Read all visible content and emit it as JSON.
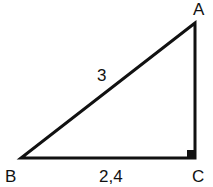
{
  "diagram": {
    "type": "right-triangle",
    "vertices": {
      "A": {
        "label": "A"
      },
      "B": {
        "label": "B"
      },
      "C": {
        "label": "C"
      }
    },
    "sides": {
      "AB": {
        "label": "3"
      },
      "BC": {
        "label": "2,4"
      }
    },
    "right_angle_at": "C",
    "colors": {
      "stroke": "#111111",
      "background": "#ffffff"
    }
  }
}
